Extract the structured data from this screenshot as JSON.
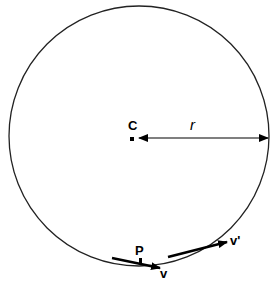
{
  "diagram": {
    "labels": {
      "center": "C",
      "radius": "r",
      "point": "P",
      "velocity": "v",
      "velocity_prime": "v'"
    },
    "colors": {
      "stroke": "#000000",
      "background": "#ffffff"
    }
  }
}
